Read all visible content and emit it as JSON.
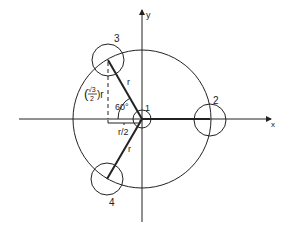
{
  "diagram": {
    "axes": {
      "x_label": "x",
      "y_label": "y"
    },
    "circles": [
      {
        "id": 1,
        "label": "1"
      },
      {
        "id": 2,
        "label": "2"
      },
      {
        "id": 3,
        "label": "3"
      },
      {
        "id": 4,
        "label": "4"
      }
    ],
    "annotations": {
      "radius_upper": "r",
      "radius_lower": "r",
      "angle": "60°",
      "half_r": "r/2",
      "height_prefix": "(",
      "sqrt3": "√3",
      "two": "2",
      "height_suffix": ")r"
    },
    "colors": {
      "stroke": "#222222",
      "background": "#ffffff"
    }
  }
}
